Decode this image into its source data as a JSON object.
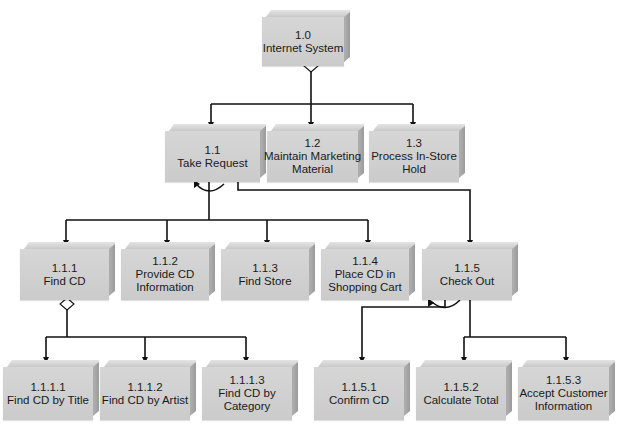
{
  "diagram": {
    "type": "structure-chart",
    "nodes": {
      "n1_0": {
        "id": "1.0",
        "label_lines": [
          "Internet System"
        ]
      },
      "n1_1": {
        "id": "1.1",
        "label_lines": [
          "Take Request"
        ]
      },
      "n1_2": {
        "id": "1.2",
        "label_lines": [
          "Maintain Marketing",
          "Material"
        ]
      },
      "n1_3": {
        "id": "1.3",
        "label_lines": [
          "Process In-Store",
          "Hold"
        ]
      },
      "n1_1_1": {
        "id": "1.1.1",
        "label_lines": [
          "Find CD"
        ]
      },
      "n1_1_2": {
        "id": "1.1.2",
        "label_lines": [
          "Provide CD",
          "Information"
        ]
      },
      "n1_1_3": {
        "id": "1.1.3",
        "label_lines": [
          "Find Store"
        ]
      },
      "n1_1_4": {
        "id": "1.1.4",
        "label_lines": [
          "Place CD in",
          "Shopping Cart"
        ]
      },
      "n1_1_5": {
        "id": "1.1.5",
        "label_lines": [
          "Check Out"
        ]
      },
      "n1_1_1_1": {
        "id": "1.1.1.1",
        "label_lines": [
          "Find CD by Title"
        ]
      },
      "n1_1_1_2": {
        "id": "1.1.1.2",
        "label_lines": [
          "Find CD by Artist"
        ]
      },
      "n1_1_1_3": {
        "id": "1.1.1.3",
        "label_lines": [
          "Find CD by",
          "Category"
        ]
      },
      "n1_1_5_1": {
        "id": "1.1.5.1",
        "label_lines": [
          "Confirm CD"
        ]
      },
      "n1_1_5_2": {
        "id": "1.1.5.2",
        "label_lines": [
          "Calculate Total"
        ]
      },
      "n1_1_5_3": {
        "id": "1.1.5.3",
        "label_lines": [
          "Accept Customer",
          "Information"
        ]
      }
    },
    "edges": [
      {
        "from": "1.0",
        "to": "1.1"
      },
      {
        "from": "1.0",
        "to": "1.2"
      },
      {
        "from": "1.0",
        "to": "1.3"
      },
      {
        "from": "1.1",
        "to": "1.1.1"
      },
      {
        "from": "1.1",
        "to": "1.1.2"
      },
      {
        "from": "1.1",
        "to": "1.1.3"
      },
      {
        "from": "1.1",
        "to": "1.1.4"
      },
      {
        "from": "1.1",
        "to": "1.1.5"
      },
      {
        "from": "1.1.1",
        "to": "1.1.1.1"
      },
      {
        "from": "1.1.1",
        "to": "1.1.1.2"
      },
      {
        "from": "1.1.1",
        "to": "1.1.1.3"
      },
      {
        "from": "1.1.5",
        "to": "1.1.5.1"
      },
      {
        "from": "1.1.5",
        "to": "1.1.5.2"
      },
      {
        "from": "1.1.5",
        "to": "1.1.5.3"
      }
    ],
    "markers": [
      {
        "node": "1.0",
        "type": "selection-diamond"
      },
      {
        "node": "1.1",
        "type": "iteration-loop"
      },
      {
        "node": "1.1.1",
        "type": "selection-diamond"
      },
      {
        "node": "1.1.5",
        "type": "iteration-loop"
      }
    ],
    "colors": {
      "box_face": "#d0d0d0",
      "box_side": "#a5a5a5",
      "line": "#111111",
      "text": "#1a1a1a"
    }
  }
}
